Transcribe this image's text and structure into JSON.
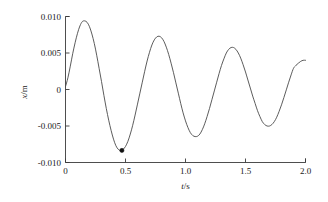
{
  "chart_data": {
    "type": "line",
    "title": "",
    "subtitle": "",
    "xlabel": "t/s",
    "ylabel": "x/m",
    "xlabel_parts": {
      "symbol": "t",
      "unit": "s",
      "separator": "/"
    },
    "ylabel_parts": {
      "symbol": "x",
      "unit": "m",
      "separator": "/"
    },
    "xlim": [
      0,
      2.0
    ],
    "ylim": [
      -0.01,
      0.01
    ],
    "xticks": [
      0,
      0.5,
      1.0,
      1.5,
      2.0
    ],
    "xticklabels": [
      "0",
      "0.5",
      "1.0",
      "1.5",
      "2.0"
    ],
    "yticks": [
      0.01,
      0.005,
      0,
      -0.005,
      -0.01
    ],
    "yticklabels": [
      "0.010",
      "0.005",
      "0",
      "-0.005",
      "-0.010"
    ],
    "grid": false,
    "legend": null,
    "legend_position": "none",
    "series": [
      {
        "name": "damped oscillation",
        "color": "#4a4a4a",
        "x": [
          0.0,
          0.02,
          0.04,
          0.06,
          0.08,
          0.1,
          0.12,
          0.14,
          0.16,
          0.18,
          0.2,
          0.22,
          0.24,
          0.26,
          0.28,
          0.3,
          0.32,
          0.34,
          0.36,
          0.38,
          0.4,
          0.42,
          0.44,
          0.46,
          0.48,
          0.5,
          0.52,
          0.54,
          0.56,
          0.58,
          0.6,
          0.62,
          0.64,
          0.66,
          0.68,
          0.7,
          0.72,
          0.74,
          0.76,
          0.78,
          0.8,
          0.82,
          0.84,
          0.86,
          0.88,
          0.9,
          0.92,
          0.94,
          0.96,
          0.98,
          1.0,
          1.02,
          1.04,
          1.06,
          1.08,
          1.1,
          1.12,
          1.14,
          1.16,
          1.18,
          1.2,
          1.22,
          1.24,
          1.26,
          1.28,
          1.3,
          1.32,
          1.34,
          1.36,
          1.38,
          1.4,
          1.42,
          1.44,
          1.46,
          1.48,
          1.5,
          1.52,
          1.54,
          1.56,
          1.58,
          1.6,
          1.62,
          1.64,
          1.66,
          1.68,
          1.7,
          1.72,
          1.74,
          1.76,
          1.78,
          1.8,
          1.82,
          1.84,
          1.86,
          1.88,
          1.9,
          1.92,
          1.94,
          1.96,
          1.98,
          2.0
        ],
        "y": [
          0.0004,
          0.0016,
          0.0032,
          0.0049,
          0.0064,
          0.0077,
          0.0087,
          0.0093,
          0.0094,
          0.0092,
          0.0086,
          0.0076,
          0.0063,
          0.0047,
          0.0029,
          0.0011,
          -0.0008,
          -0.0026,
          -0.0042,
          -0.0056,
          -0.0068,
          -0.0077,
          -0.0082,
          -0.00835,
          -0.0082,
          -0.0078,
          -0.0071,
          -0.0061,
          -0.0049,
          -0.0035,
          -0.002,
          -0.0005,
          0.001,
          0.0025,
          0.0039,
          0.0051,
          0.0061,
          0.0068,
          0.0072,
          0.0073,
          0.0071,
          0.0066,
          0.0058,
          0.0048,
          0.0036,
          0.0023,
          0.0009,
          -0.0005,
          -0.0019,
          -0.0032,
          -0.0043,
          -0.0052,
          -0.0059,
          -0.0063,
          -0.00645,
          -0.0064,
          -0.0061,
          -0.0055,
          -0.0047,
          -0.0037,
          -0.0026,
          -0.0014,
          -0.0002,
          0.001,
          0.0022,
          0.0033,
          0.0042,
          0.005,
          0.0055,
          0.00575,
          0.00575,
          0.0055,
          0.005,
          0.0043,
          0.0034,
          0.0024,
          0.0013,
          0.0002,
          -0.0009,
          -0.0019,
          -0.0029,
          -0.0037,
          -0.0044,
          -0.0048,
          -0.005,
          -0.005,
          -0.0048,
          -0.0044,
          -0.0038,
          -0.003,
          -0.0021,
          -0.0011,
          -5e-05,
          0.001,
          0.002,
          0.0029,
          0.0033,
          0.0036,
          0.00385,
          0.004,
          0.004
        ]
      }
    ],
    "markers": [
      {
        "label": "minimum",
        "x": 0.47,
        "y": -0.00835,
        "color": "#111111"
      }
    ],
    "annotations": []
  }
}
